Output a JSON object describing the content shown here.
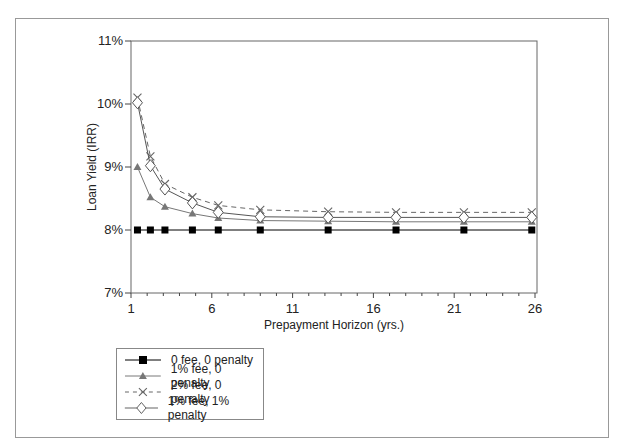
{
  "chart_data": {
    "type": "line",
    "title": "",
    "xlabel": "Prepayment Horizon (yrs.)",
    "ylabel": "Loan Yield (IRR)",
    "xlim": [
      1,
      26
    ],
    "ylim": [
      7,
      11
    ],
    "x_ticks": [
      "1",
      "6",
      "11",
      "16",
      "21",
      "26"
    ],
    "y_ticks": [
      "7%",
      "8%",
      "9%",
      "10%",
      "11%"
    ],
    "grid": false,
    "legend_position": "below-left",
    "x": [
      1.4,
      2.2,
      3.1,
      4.8,
      6.4,
      9.0,
      13.2,
      17.4,
      21.6,
      25.8
    ],
    "series": [
      {
        "name": "0 fee, 0 penalty",
        "marker": "square",
        "line": "solid",
        "color": "#000000",
        "values": [
          8.0,
          8.0,
          8.0,
          8.0,
          8.0,
          8.0,
          8.0,
          8.0,
          8.0,
          8.0
        ]
      },
      {
        "name": "1% fee, 0 penalty",
        "marker": "triangle",
        "line": "solid",
        "color": "#777777",
        "values": [
          9.0,
          8.52,
          8.37,
          8.26,
          8.19,
          8.15,
          8.14,
          8.13,
          8.13,
          8.13
        ]
      },
      {
        "name": "2% fee, 0 penalty",
        "marker": "x",
        "line": "dashed",
        "color": "#666666",
        "values": [
          10.1,
          9.17,
          8.73,
          8.52,
          8.39,
          8.32,
          8.29,
          8.28,
          8.28,
          8.28
        ]
      },
      {
        "name": "1% fee, 1% penalty",
        "marker": "diamond",
        "line": "solid",
        "color": "#555555",
        "values": [
          10.02,
          9.02,
          8.65,
          8.43,
          8.28,
          8.21,
          8.2,
          8.2,
          8.2,
          8.2
        ]
      }
    ]
  },
  "legend": {
    "items": [
      {
        "label": "0 fee, 0 penalty"
      },
      {
        "label": "1% fee, 0 penalty"
      },
      {
        "label": "2% fee, 0 penalty"
      },
      {
        "label": "1% fee, 1% penalty"
      }
    ]
  }
}
